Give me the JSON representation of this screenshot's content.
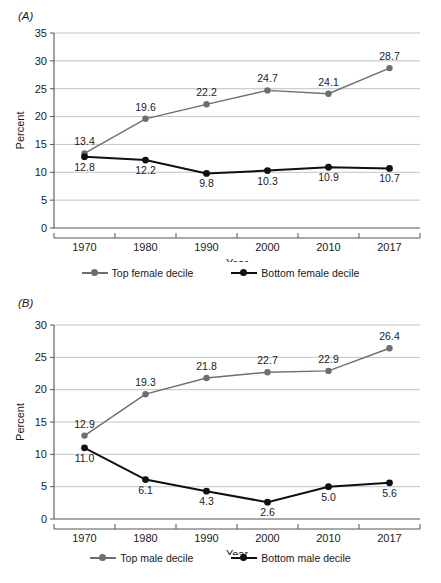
{
  "figure": {
    "background_color": "#ffffff",
    "panels": [
      {
        "panel_label": "(A)",
        "chart_data": {
          "type": "line",
          "title": "",
          "xlabel": "Year",
          "ylabel": "Percent",
          "categories": [
            "1970",
            "1980",
            "1990",
            "2000",
            "2010",
            "2017"
          ],
          "x": [
            1970,
            1980,
            1990,
            2000,
            2010,
            2017
          ],
          "ylim": [
            0,
            35
          ],
          "ytick_step": 5,
          "yticks": [
            "0",
            "5",
            "10",
            "15",
            "20",
            "25",
            "30",
            "35"
          ],
          "grid": true,
          "legend_position": "bottom",
          "series": [
            {
              "name": "Top female decile",
              "color": "#6e6e6e",
              "values": [
                13.4,
                19.6,
                22.2,
                24.7,
                24.1,
                28.7
              ],
              "labels": [
                "13.4",
                "19.6",
                "22.2",
                "24.7",
                "24.1",
                "28.7"
              ],
              "label_positions": [
                "above",
                "above",
                "above",
                "above",
                "above",
                "above"
              ]
            },
            {
              "name": "Bottom female decile",
              "color": "#101010",
              "values": [
                12.8,
                12.2,
                9.8,
                10.3,
                10.9,
                10.7
              ],
              "labels": [
                "12.8",
                "12.2",
                "9.8",
                "10.3",
                "10.9",
                "10.7"
              ],
              "label_positions": [
                "below",
                "below",
                "below",
                "below",
                "below",
                "below"
              ]
            }
          ]
        }
      },
      {
        "panel_label": "(B)",
        "chart_data": {
          "type": "line",
          "title": "",
          "xlabel": "Year",
          "ylabel": "Percent",
          "categories": [
            "1970",
            "1980",
            "1990",
            "2000",
            "2010",
            "2017"
          ],
          "x": [
            1970,
            1980,
            1990,
            2000,
            2010,
            2017
          ],
          "ylim": [
            0,
            30
          ],
          "ytick_step": 5,
          "yticks": [
            "0",
            "5",
            "10",
            "15",
            "20",
            "25",
            "30"
          ],
          "grid": true,
          "legend_position": "bottom",
          "series": [
            {
              "name": "Top male decile",
              "color": "#6e6e6e",
              "values": [
                12.9,
                19.3,
                21.8,
                22.7,
                22.9,
                26.4
              ],
              "labels": [
                "12.9",
                "19.3",
                "21.8",
                "22.7",
                "22.9",
                "26.4"
              ],
              "label_positions": [
                "above",
                "above",
                "above",
                "above",
                "above",
                "above"
              ]
            },
            {
              "name": "Bottom male decile",
              "color": "#101010",
              "values": [
                11.0,
                6.1,
                4.3,
                2.6,
                5.0,
                5.6
              ],
              "labels": [
                "11.0",
                "6.1",
                "4.3",
                "2.6",
                "5.0",
                "5.6"
              ],
              "label_positions": [
                "below",
                "below",
                "below",
                "below",
                "below",
                "below"
              ]
            }
          ]
        }
      }
    ]
  }
}
